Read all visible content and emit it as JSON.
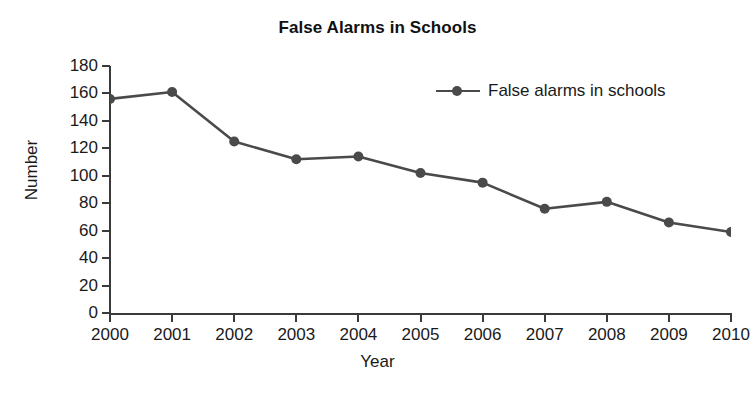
{
  "chart_data": {
    "type": "line",
    "title": "False Alarms in Schools",
    "xlabel": "Year",
    "ylabel": "Number",
    "categories": [
      "2000",
      "2001",
      "2002",
      "2003",
      "2004",
      "2005",
      "2006",
      "2007",
      "2008",
      "2009",
      "2010"
    ],
    "values": [
      156,
      161,
      125,
      112,
      114,
      102,
      95,
      76,
      81,
      66,
      59
    ],
    "series": [
      {
        "name": "False alarms in schools",
        "values": [
          156,
          161,
          125,
          112,
          114,
          102,
          95,
          76,
          81,
          66,
          59
        ]
      }
    ],
    "ylim": [
      0,
      180
    ],
    "yticks": [
      0,
      20,
      40,
      60,
      80,
      100,
      120,
      140,
      160,
      180
    ],
    "ytick_labels": [
      "0",
      "20",
      "40",
      "60",
      "80",
      "100",
      "120",
      "140",
      "160",
      "180"
    ],
    "xtick_labels": [
      "2000",
      "2001",
      "2002",
      "2003",
      "2004",
      "2005",
      "2006",
      "2007",
      "2008",
      "2009",
      "2010"
    ],
    "grid": false,
    "legend": {
      "position": "top-right",
      "entries": [
        "False alarms in schools"
      ]
    },
    "marker": "circle",
    "colors": {
      "line": "#4a4a4a",
      "marker": "#4a4a4a",
      "axis": "#3a3a3a",
      "text": "#1a1a1a",
      "background": "#ffffff"
    }
  },
  "legend_label": "False alarms in schools"
}
